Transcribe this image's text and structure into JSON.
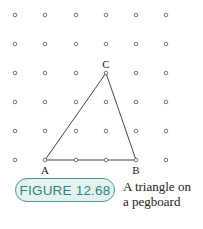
{
  "figure": {
    "badge_label": "FIGURE 12.68",
    "caption_line1": "A triangle on",
    "caption_line2": "a pegboard",
    "accent_color": "#2f8478",
    "badge_fill": "#e4f3f1"
  },
  "pegboard": {
    "columns": 6,
    "rows": 6,
    "col_x": [
      15,
      45,
      76,
      106,
      136,
      166
    ],
    "row_y": [
      15,
      44,
      73,
      102,
      131,
      160
    ]
  },
  "triangle": {
    "vertices": [
      {
        "label": "A",
        "col": 1,
        "row": 5
      },
      {
        "label": "B",
        "col": 4,
        "row": 5
      },
      {
        "label": "C",
        "col": 3,
        "row": 2
      }
    ]
  }
}
